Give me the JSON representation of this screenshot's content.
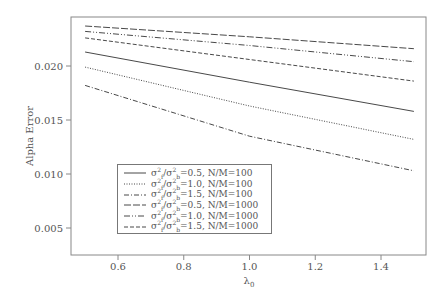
{
  "chart_data": {
    "type": "line",
    "title": "",
    "xlabel": "λ0",
    "ylabel": "Alpha Error",
    "xlim": [
      0.45,
      1.55
    ],
    "ylim": [
      0.0024,
      0.0245
    ],
    "x_ticks": [
      "0.6",
      "0.8",
      "1.0",
      "1.2",
      "1.4"
    ],
    "y_ticks": [
      "0.005",
      "0.010",
      "0.015",
      "0.020"
    ],
    "grid": false,
    "legend_position": "lower-left inside",
    "x": [
      0.5,
      1.0,
      1.5
    ],
    "series": [
      {
        "name": "σ²f/σ²b=0.5, N/M=100",
        "style": "solid",
        "values": [
          0.0213,
          0.0185,
          0.0158
        ]
      },
      {
        "name": "σ²f/σ²b=1.0, N/M=100",
        "style": "dotted",
        "values": [
          0.0199,
          0.0163,
          0.0132
        ]
      },
      {
        "name": "σ²f/σ²b=1.5, N/M=100",
        "style": "dashdot",
        "values": [
          0.0182,
          0.0135,
          0.0103
        ]
      },
      {
        "name": "σ²f/σ²b=0.5, N/M=1000",
        "style": "longdash",
        "values": [
          0.0237,
          0.0227,
          0.0216
        ]
      },
      {
        "name": "σ²f/σ²b=1.0, N/M=1000",
        "style": "dashdotdot",
        "values": [
          0.0232,
          0.0219,
          0.0204
        ]
      },
      {
        "name": "σ²f/σ²b=1.5, N/M=1000",
        "style": "dashed",
        "values": [
          0.0226,
          0.0206,
          0.0186
        ]
      }
    ]
  },
  "legend": {
    "items": [
      {
        "ratio": "0.5",
        "nm": "100"
      },
      {
        "ratio": "1.0",
        "nm": "100"
      },
      {
        "ratio": "1.5",
        "nm": "100"
      },
      {
        "ratio": "0.5",
        "nm": "1000"
      },
      {
        "ratio": "1.0",
        "nm": "1000"
      },
      {
        "ratio": "1.5",
        "nm": "1000"
      }
    ]
  }
}
